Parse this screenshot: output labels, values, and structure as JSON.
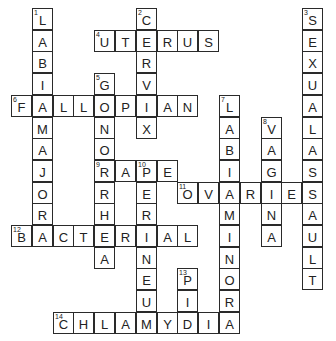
{
  "puzzle": {
    "grid": {
      "origin_x": 11,
      "origin_y": 8,
      "cell_w": 20.8,
      "cell_h": 21.7
    },
    "words": [
      {
        "number": 1,
        "direction": "down",
        "answer": "LABIAMAJORA",
        "row": 0,
        "col": 1
      },
      {
        "number": 2,
        "direction": "down",
        "answer": "CERVIX",
        "row": 0,
        "col": 6
      },
      {
        "number": 3,
        "direction": "down",
        "answer": "SEXUALASSAULT",
        "row": 0,
        "col": 14
      },
      {
        "number": 4,
        "direction": "across",
        "answer": "UTERUS",
        "row": 1,
        "col": 4
      },
      {
        "number": 5,
        "direction": "down",
        "answer": "GONORRHEA",
        "row": 3,
        "col": 4
      },
      {
        "number": 6,
        "direction": "across",
        "answer": "FALLOPIAN",
        "row": 4,
        "col": 0
      },
      {
        "number": 7,
        "direction": "down",
        "answer": "LABIAMINORA",
        "row": 4,
        "col": 10
      },
      {
        "number": 8,
        "direction": "down",
        "answer": "VAGINA",
        "row": 5,
        "col": 12
      },
      {
        "number": 9,
        "direction": "across",
        "answer": "RAPE",
        "row": 7,
        "col": 4
      },
      {
        "number": 10,
        "direction": "down",
        "answer": "PERINEUM",
        "row": 7,
        "col": 6
      },
      {
        "number": 11,
        "direction": "across",
        "answer": "OVARIES",
        "row": 8,
        "col": 8
      },
      {
        "number": 12,
        "direction": "across",
        "answer": "BACTERIAL",
        "row": 10,
        "col": 0
      },
      {
        "number": 13,
        "direction": "down",
        "answer": "PID",
        "row": 12,
        "col": 8
      },
      {
        "number": 14,
        "direction": "across",
        "answer": "CHLAMYDIA",
        "row": 14,
        "col": 2
      }
    ]
  }
}
